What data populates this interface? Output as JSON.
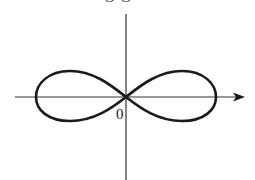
{
  "diagram": {
    "type": "lemniscate",
    "axes": {
      "x_axis": {
        "arrow": true
      },
      "y_axis": {
        "arrow": false
      }
    },
    "labels": {
      "origin": "0",
      "top_partial": "O O"
    },
    "colors": {
      "stroke": "#1a1a1a",
      "background": "#ffffff"
    }
  }
}
